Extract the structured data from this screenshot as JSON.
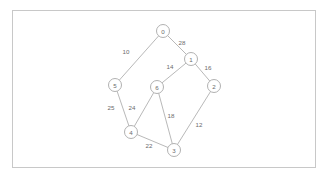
{
  "figure": {
    "background_color": "#ffffff",
    "frame": {
      "x": 12,
      "y": 10,
      "width": 304,
      "height": 158,
      "stroke_color": "#c8c8c8",
      "fill_color": "#ffffff"
    }
  },
  "chart_data": {
    "type": "diagram",
    "diagram_type": "undirected-weighted-graph",
    "title": "",
    "xlabel": "",
    "ylabel": "",
    "node_style": {
      "radius": 6.5,
      "fill_color": "#ffffff",
      "stroke_color": "#a8a8a8",
      "label_color": "#6b6b6b"
    },
    "edge_style": {
      "stroke_color": "#b0b0b0",
      "label_color": "#6b6b6b"
    },
    "nodes": [
      {
        "id": "0",
        "label": "0",
        "x": 163,
        "y": 31
      },
      {
        "id": "1",
        "label": "1",
        "x": 191,
        "y": 59
      },
      {
        "id": "2",
        "label": "2",
        "x": 214,
        "y": 86
      },
      {
        "id": "3",
        "label": "3",
        "x": 174,
        "y": 150
      },
      {
        "id": "4",
        "label": "4",
        "x": 131,
        "y": 132
      },
      {
        "id": "5",
        "label": "5",
        "x": 115,
        "y": 85
      },
      {
        "id": "6",
        "label": "6",
        "x": 157,
        "y": 87
      }
    ],
    "edges": [
      {
        "source": "0",
        "target": "5",
        "weight": 10,
        "label": "10",
        "label_x": 126,
        "label_y": 51
      },
      {
        "source": "0",
        "target": "1",
        "weight": 28,
        "label": "28",
        "label_x": 182,
        "label_y": 42
      },
      {
        "source": "1",
        "target": "6",
        "weight": 14,
        "label": "14",
        "label_x": 170,
        "label_y": 66
      },
      {
        "source": "1",
        "target": "2",
        "weight": 16,
        "label": "16",
        "label_x": 208,
        "label_y": 67
      },
      {
        "source": "5",
        "target": "4",
        "weight": 25,
        "label": "25",
        "label_x": 111,
        "label_y": 107
      },
      {
        "source": "6",
        "target": "4",
        "weight": 24,
        "label": "24",
        "label_x": 132,
        "label_y": 107
      },
      {
        "source": "6",
        "target": "3",
        "weight": 18,
        "label": "18",
        "label_x": 171,
        "label_y": 115
      },
      {
        "source": "4",
        "target": "3",
        "weight": 22,
        "label": "22",
        "label_x": 149,
        "label_y": 145
      },
      {
        "source": "2",
        "target": "3",
        "weight": 12,
        "label": "12",
        "label_x": 199,
        "label_y": 124
      }
    ]
  }
}
